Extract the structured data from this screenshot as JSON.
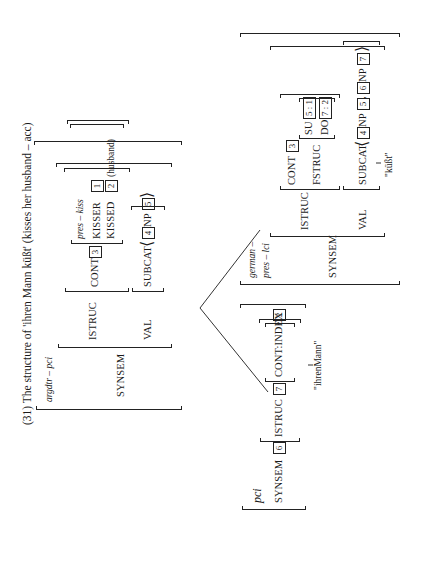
{
  "title": "(31) The structure of 'ihren Mann küßt' (kisses her husband – acc)",
  "mother": {
    "type": "argdtr – pci",
    "synsem_label": "SYNSEM",
    "istruc_label": "ISTRUC",
    "cont_label": "CONT",
    "cont_tag": "3",
    "cont_type": "pres – kiss",
    "kisser_label": "KISSER",
    "kisser_tag": "1",
    "kissed_label": "KISSED",
    "kissed_tag": "2",
    "kissed_note": "(husband)",
    "val_label": "VAL",
    "subcat_label": "SUBCAT",
    "subcat_tag1": "4",
    "subcat_np": "NP",
    "subcat_tag2": "5"
  },
  "left_daughter": {
    "type": "pci",
    "synsem_label": "SYNSEM",
    "synsem_tag": "6",
    "istruc_label": "ISTRUC",
    "istruc_tag": "7",
    "cont_index_label": "CONT:INDEX",
    "cont_index_tag": "2",
    "word": "\"ihrenMann\""
  },
  "right_daughter": {
    "type_line1": "german –",
    "type_line2": "pres – lci",
    "synsem_label": "SYNSEM",
    "istruc_label": "ISTRUC",
    "cont_label": "CONT",
    "cont_tag": "3",
    "fstruc_label": "FSTRUC",
    "su_label": "SU",
    "su_tag": "5 : 1",
    "do_label": "DO",
    "do_tag": "7 : 2",
    "val_label": "VAL",
    "subcat_label": "SUBCAT",
    "subcat_tag1": "4",
    "subcat_np1": "NP",
    "subcat_tag2": "5",
    "subcat_sep": ",",
    "subcat_tag3": "6",
    "subcat_np2": "NP",
    "subcat_tag4": "7",
    "word": "\"küßt\""
  }
}
